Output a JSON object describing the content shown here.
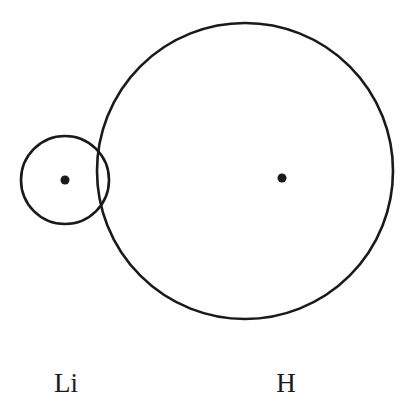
{
  "diagram": {
    "stroke_color": "#1a1a1a",
    "atoms": [
      {
        "symbol": "Li",
        "label": "Li",
        "circle": {
          "cx": 65,
          "cy": 180,
          "r": 44
        },
        "nucleus": {
          "cx": 65,
          "cy": 180,
          "r": 4.5
        },
        "label_pos": {
          "x": 66,
          "y": 370
        }
      },
      {
        "symbol": "H",
        "label": "H",
        "circle": {
          "cx": 245,
          "cy": 171,
          "r": 148
        },
        "nucleus": {
          "cx": 282,
          "cy": 178,
          "r": 4.5
        },
        "label_pos": {
          "x": 286,
          "y": 370
        }
      }
    ]
  }
}
